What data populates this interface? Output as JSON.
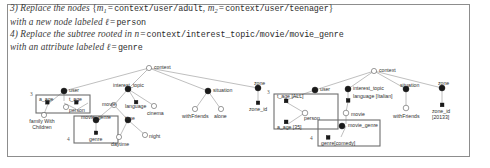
{
  "rules": {
    "line1": {
      "prefix": "3) Replace the nodes ",
      "open_brace": "{",
      "m1": "m",
      "m1_sub": "1",
      "eq1": "=",
      "path1": "context/user/adult",
      "comma": ", ",
      "m2": "m",
      "m2_sub": "2",
      "eq2": "=",
      "path2": "context/user/teenager",
      "close_brace": "}"
    },
    "line2": {
      "prefix": "with a new node labeled ",
      "ell": "ℓ",
      "eq": "=",
      "value": "person"
    },
    "line3": {
      "prefix": "4) Replace the subtree rooted in ",
      "n": "n",
      "eq": "=",
      "path": "context/interest_topic/movie/movie_genre"
    },
    "line4": {
      "prefix": "with an attribute labeled ",
      "ell": "ℓ",
      "eq": "=",
      "value": "genre"
    }
  },
  "left_tree": {
    "caption_mark_3": "3",
    "caption_mark_4": "4",
    "nodes": {
      "context": "context",
      "user": "user",
      "interest_topic": "interest_topic",
      "situation": "situation",
      "zone": "zone",
      "a_age": "a_age",
      "t_age": "t_age",
      "person": "person",
      "family_with_children": "family With Children",
      "movie": "movie",
      "language": "language",
      "cinema": "cinema",
      "movie_genre": "movie_genre",
      "genre": "genre",
      "time": "time",
      "daytime": "daytime",
      "night": "night",
      "withFriends": "withFriends",
      "alone": "alone",
      "zone_id": "zone_id"
    }
  },
  "right_tree": {
    "caption_mark_3": "3",
    "caption_mark_4": "4",
    "nodes": {
      "context": "context",
      "user": "user",
      "interest_topic": "interest_topic",
      "situation": "situation",
      "zone": "zone",
      "t_age": "t_age [ALL]",
      "a_age": "a_age [35]",
      "person": "person",
      "language": "language [Italian]",
      "movie": "movie",
      "movie_genre": "movie_genre",
      "genre": "genre[comedy]",
      "withFriends": "withFriends",
      "zone_id_line1": "zone_id",
      "zone_id_line2": "[20133]"
    }
  },
  "colors": {
    "frame_border": "#8d8d8d",
    "node_fill_dark": "#1a1a1a",
    "node_fill_light": "#ffffff",
    "node_stroke": "#2b2b2b",
    "edge": "#8a8a8a",
    "box_stroke": "#6e6e6e",
    "text": "#2f2f2f"
  }
}
